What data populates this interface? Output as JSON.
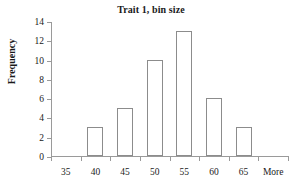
{
  "chart_data": {
    "type": "bar",
    "title": "Trait 1, bin size",
    "xlabel": "",
    "ylabel": "Frequency",
    "categories": [
      "35",
      "40",
      "45",
      "50",
      "55",
      "60",
      "65",
      "More"
    ],
    "values": [
      0,
      3,
      5,
      10,
      13,
      6,
      3,
      0
    ],
    "ylim": [
      0,
      14
    ],
    "yticks": [
      0,
      2,
      4,
      6,
      8,
      10,
      12,
      14
    ],
    "ytick_labels": [
      "0",
      "2",
      "4",
      "6",
      "8",
      "10",
      "12",
      "14"
    ],
    "grid": false,
    "legend": null,
    "bar_fill_color": "#ffffff",
    "bar_border_color": "#8c8c8c",
    "axis_color": "#9a9a9a",
    "text_color": "#1a1a1a"
  }
}
